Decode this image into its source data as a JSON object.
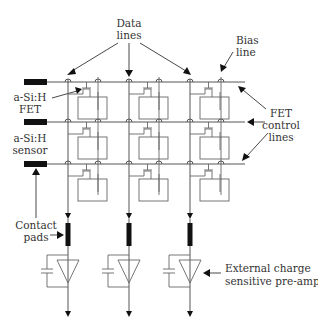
{
  "diagram": {
    "labels": {
      "data_lines": [
        "Data",
        "lines"
      ],
      "bias_line": [
        "Bias",
        "line"
      ],
      "fet": [
        "a-Si:H",
        "FET"
      ],
      "sensor": [
        "a-Si:H",
        "sensor"
      ],
      "fet_control_lines": [
        "FET",
        "control",
        "lines"
      ],
      "contact_pads": [
        "Contact",
        "pads"
      ],
      "preamp": [
        "External charge",
        "sensitive pre-amp"
      ]
    },
    "array": {
      "rows": 3,
      "columns": 3,
      "data_line_x": [
        68,
        129,
        190
      ],
      "bias_line_x": [
        98,
        159,
        221
      ],
      "control_line_y": [
        82,
        122,
        164
      ]
    },
    "colors": {
      "line": "#555555",
      "pad": "#111111",
      "text": "#333333",
      "background": "#ffffff"
    }
  }
}
